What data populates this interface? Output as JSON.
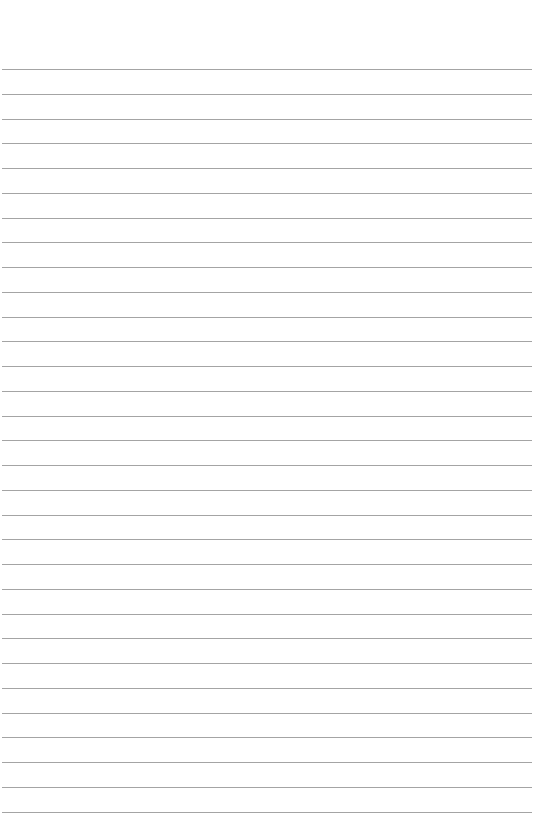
{
  "page": {
    "type": "lined-paper",
    "background_color": "#ffffff",
    "line_color": "#a4a4a4",
    "line_count": 31,
    "first_line_y": 69,
    "line_spacing": 24.75,
    "line_left": 2,
    "line_right": 532
  }
}
